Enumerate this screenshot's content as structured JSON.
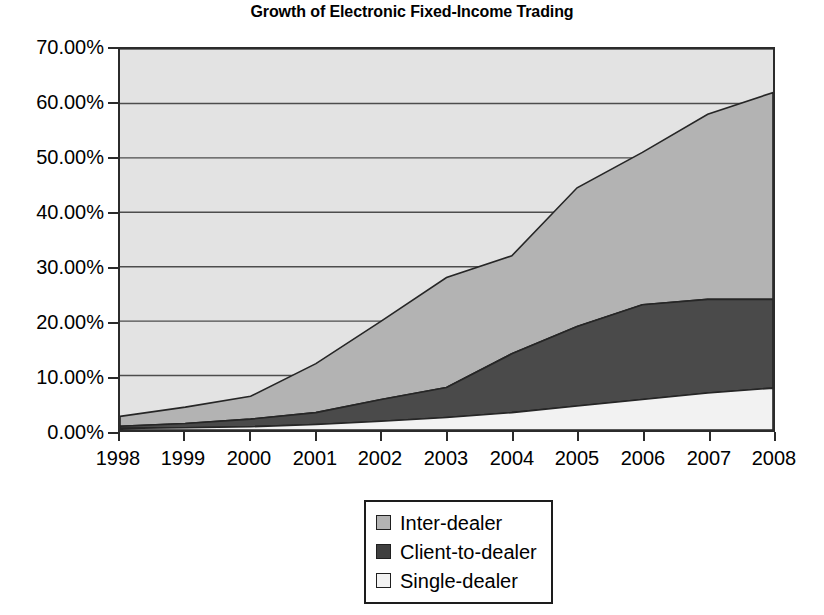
{
  "chart_data": {
    "type": "area",
    "title": "Growth of Electronic Fixed-Income Trading",
    "subtitle": "",
    "xlabel": "",
    "ylabel": "",
    "stacked": true,
    "grid": true,
    "grid_axis": "y",
    "legend_position": "bottom-center",
    "x": [
      1998,
      1999,
      2000,
      2001,
      2002,
      2003,
      2004,
      2005,
      2006,
      2007,
      2008
    ],
    "categories": [
      "1998",
      "1999",
      "2000",
      "2001",
      "2002",
      "2003",
      "2004",
      "2005",
      "2006",
      "2007",
      "2008"
    ],
    "xtick_labels": [
      "1998",
      "1999",
      "2000",
      "2001",
      "2002",
      "2003",
      "2004",
      "2005",
      "2006",
      "2007",
      "2008"
    ],
    "ylim": [
      0,
      70
    ],
    "ytick_values": [
      0,
      10,
      20,
      30,
      40,
      50,
      60,
      70
    ],
    "ytick_labels": [
      "0.00%",
      "10.00%",
      "20.00%",
      "30.00%",
      "40.00%",
      "50.00%",
      "60.00%",
      "70.00%"
    ],
    "y_unit": "percent",
    "series": [
      {
        "name": "Single-dealer",
        "color": "#f2f2f2",
        "stack_order": 1,
        "values": [
          0.3,
          0.4,
          0.6,
          1.0,
          1.6,
          2.3,
          3.2,
          4.4,
          5.6,
          6.8,
          7.7
        ]
      },
      {
        "name": "Client-to-dealer",
        "color": "#4a4a4a",
        "stack_order": 2,
        "values": [
          0.4,
          0.8,
          1.4,
          2.2,
          4.0,
          5.5,
          10.8,
          14.6,
          17.4,
          17.2,
          16.3
        ]
      },
      {
        "name": "Inter-dealer",
        "color": "#b3b3b3",
        "stack_order": 3,
        "values": [
          1.8,
          3.0,
          4.2,
          9.0,
          14.4,
          20.2,
          18.0,
          25.5,
          28.0,
          34.0,
          38.0
        ]
      }
    ],
    "cumulative_totals": [
      2.5,
      4.2,
      6.2,
      12.2,
      20.0,
      28.0,
      32.0,
      44.5,
      51.0,
      58.0,
      62.0
    ],
    "annotations": []
  },
  "legend": {
    "items": [
      {
        "label": "Inter-dealer",
        "color": "#b3b3b3"
      },
      {
        "label": "Client-to-dealer",
        "color": "#3f3f3f"
      },
      {
        "label": "Single-dealer",
        "color": "#f2f2f2"
      }
    ]
  },
  "axis": {
    "y_labels": [
      "70.00%",
      "60.00%",
      "50.00%",
      "40.00%",
      "30.00%",
      "20.00%",
      "10.00%",
      "0.00%"
    ],
    "x_labels": [
      "1998",
      "1999",
      "2000",
      "2001",
      "2002",
      "2003",
      "2004",
      "2005",
      "2006",
      "2007",
      "2008"
    ]
  },
  "colors": {
    "plot_background": "#e3e3e3",
    "frame": "#2b2b2b",
    "gridline": "#4d4d4d",
    "inter_dealer": "#b3b3b3",
    "client_to_dealer": "#4a4a4a",
    "single_dealer": "#f2f2f2"
  }
}
